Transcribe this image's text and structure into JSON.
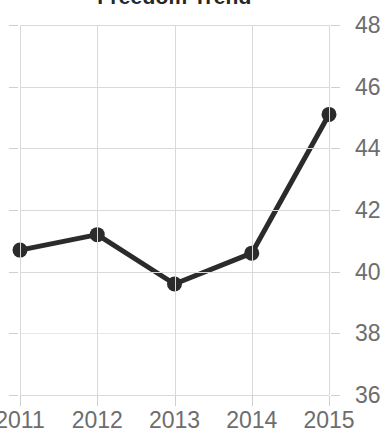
{
  "chart_data": {
    "type": "line",
    "title": "Freedom Trend",
    "xlabel": "",
    "ylabel": "",
    "categories": [
      "2011",
      "2012",
      "2013",
      "2014",
      "2015"
    ],
    "x": [
      2011,
      2012,
      2013,
      2014,
      2015
    ],
    "values": [
      40.7,
      41.2,
      39.6,
      40.6,
      45.1
    ],
    "series": [
      {
        "name": "Freedom",
        "values": [
          40.7,
          41.2,
          39.6,
          40.6,
          45.1
        ]
      }
    ],
    "xtick_labels": [
      "2011",
      "2012",
      "2013",
      "2014",
      "2015"
    ],
    "ytick_labels": [
      "48",
      "46",
      "44",
      "42",
      "40",
      "38",
      "36"
    ],
    "ytick_values": [
      48,
      46,
      44,
      42,
      40,
      38,
      36
    ],
    "ylim": [
      36,
      48
    ],
    "xlim": [
      2011,
      2015
    ],
    "grid": true,
    "legend": false,
    "legend_position": "none",
    "y_axis_side": "right",
    "marker": "circle",
    "line_color": "#2b2b2b",
    "marker_color": "#2b2b2b",
    "grid_color": "#d9d9d9",
    "tick_label_color": "#6d6d6d",
    "title_color": "#262626",
    "background_color": "#ffffff"
  }
}
